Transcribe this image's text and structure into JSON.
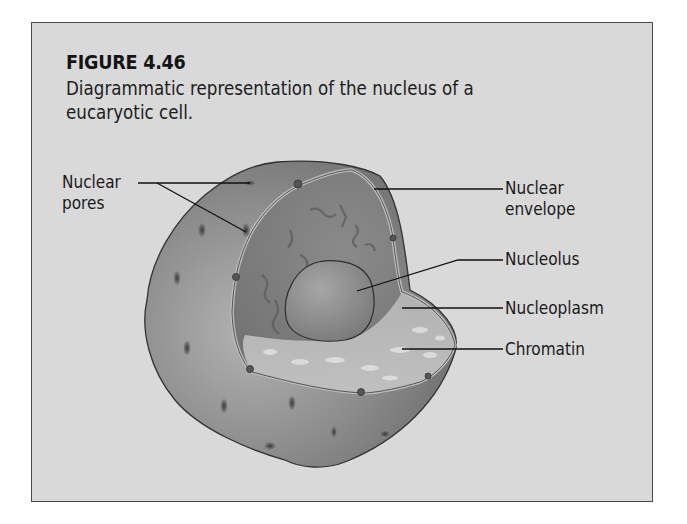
{
  "figure": {
    "title": "FIGURE 4.46",
    "caption_lines": [
      "Diagrammatic representation of the nucleus of a",
      "eucaryotic cell."
    ]
  },
  "labels": {
    "nuclear_pores": {
      "line1": "Nuclear",
      "line2": "pores"
    },
    "nuclear_envelope": {
      "line1": "Nuclear",
      "line2": "envelope"
    },
    "nucleolus": "Nucleolus",
    "nucleoplasm": "Nucleoplasm",
    "chromatin": "Chromatin"
  },
  "colors": {
    "background": "#d9d9d9",
    "border": "#4a4a4a",
    "shell": "#8f8f8f",
    "nucleoplasm": "#9a9a9a",
    "nucleolus": "#8a8a8a",
    "text": "#1a1a1a"
  }
}
